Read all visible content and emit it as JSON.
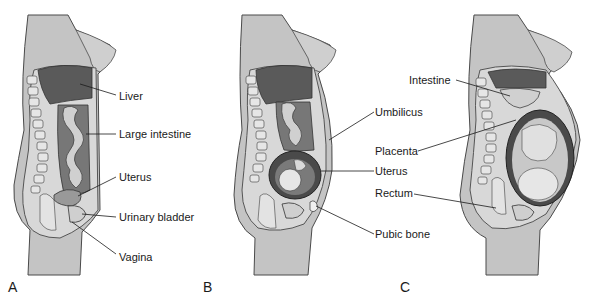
{
  "figure": {
    "panels": [
      {
        "letter": "A",
        "stage": "non-pregnant",
        "labels": [
          "Liver",
          "Large intestine",
          "Uterus",
          "Urinary bladder",
          "Vagina"
        ]
      },
      {
        "letter": "B",
        "stage": "early pregnancy",
        "labels": [
          "Umbilicus",
          "Uterus",
          "Pubic bone"
        ]
      },
      {
        "letter": "C",
        "stage": "late pregnancy",
        "labels": [
          "Intestine",
          "Placenta",
          "Rectum"
        ]
      }
    ],
    "colors": {
      "background": "#ffffff",
      "body_skin": "#bdbdbd",
      "body_light": "#d9d9d9",
      "organ_dark": "#555555",
      "organ_mid": "#8a8a8a",
      "organ_light": "#cfcfcf",
      "line": "#1a1a1a"
    }
  }
}
